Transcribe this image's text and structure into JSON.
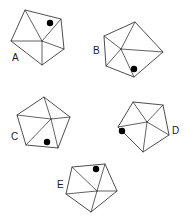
{
  "figure": {
    "background_color": "#ffffff",
    "stroke_color": "#3a3a3a",
    "marker_color": "#000000",
    "label_color": "#1a1a1a",
    "width": 186,
    "height": 218,
    "shape_count": 5,
    "shapes": [
      {
        "id": "A",
        "label": "A",
        "label_x": 12,
        "label_y": 58,
        "outline_points": "25,10 61,19 64,49 42,65 11,41",
        "hub_x": 42,
        "hub_y": 41,
        "diagonals": [
          "25,10 42,41",
          "61,19 42,41",
          "64,49 42,41",
          "11,41 42,41",
          "42,65 42,41"
        ],
        "marker_x": 50,
        "marker_y": 23,
        "marker_r": 3.2
      },
      {
        "id": "B",
        "label": "B",
        "label_x": 93,
        "label_y": 51,
        "outline_points": "135,22 163,52 134,77 106,66 104,36",
        "hub_x": 121,
        "hub_y": 49,
        "diagonals": [
          "135,22 121,49",
          "163,52 121,49",
          "134,77 121,49",
          "106,66 121,49",
          "104,36 121,49"
        ],
        "marker_x": 134,
        "marker_y": 69,
        "marker_r": 3.2
      },
      {
        "id": "C",
        "label": "C",
        "label_x": 11,
        "label_y": 137,
        "outline_points": "44,97 70,117 58,148 26,145 17,115",
        "hub_x": 51,
        "hub_y": 119,
        "diagonals": [
          "44,97 51,119",
          "70,117 51,119",
          "58,148 51,119",
          "26,145 51,119",
          "17,115 51,119"
        ],
        "marker_x": 47,
        "marker_y": 142,
        "marker_r": 3.2
      },
      {
        "id": "D",
        "label": "D",
        "label_x": 172,
        "label_y": 131,
        "outline_points": "133,102 163,105 169,135 143,152 118,127",
        "hub_x": 147,
        "hub_y": 122,
        "diagonals": [
          "133,102 147,122",
          "163,105 147,122",
          "169,135 147,122",
          "143,152 147,122",
          "118,127 147,122"
        ],
        "marker_x": 122,
        "marker_y": 131,
        "marker_r": 3.2
      },
      {
        "id": "E",
        "label": "E",
        "label_x": 57,
        "label_y": 185,
        "outline_points": "72,167 105,164 117,191 91,212 66,194",
        "hub_x": 97,
        "hub_y": 191,
        "diagonals": [
          "72,167 97,191",
          "105,164 97,191",
          "117,191 97,191",
          "91,212 97,191",
          "66,194 97,191"
        ],
        "marker_x": 96,
        "marker_y": 169,
        "marker_r": 3.2
      }
    ]
  }
}
